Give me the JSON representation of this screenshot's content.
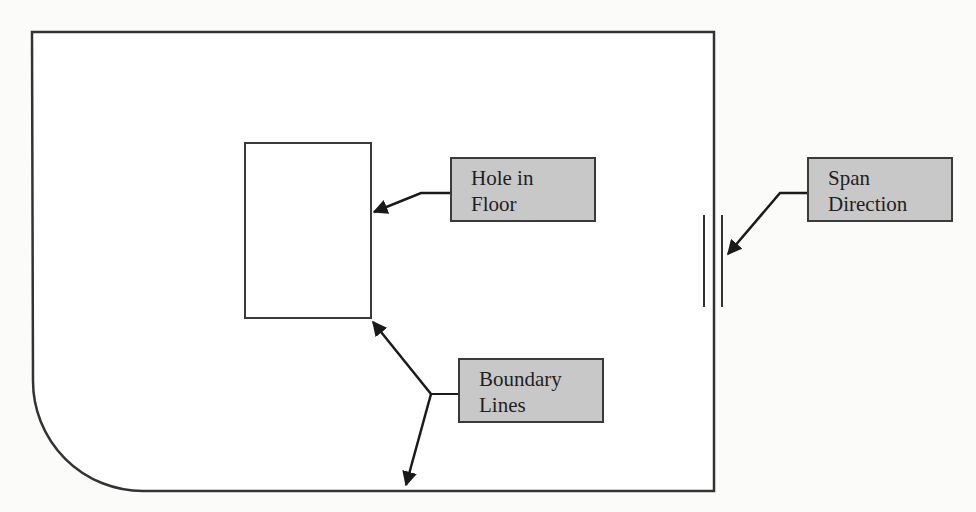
{
  "diagram": {
    "type": "floor-plan-annotation",
    "colors": {
      "stroke": "#333333",
      "label_fill": "#c8c8c8",
      "label_border": "#3a3a3a",
      "background": "#fbfbfa"
    },
    "shapes": {
      "outer_boundary": "Floor slab outline with rounded bottom-left corner",
      "hole": "Rectangular hole in floor",
      "span_indicator": "Three parallel vertical lines indicating span direction"
    },
    "labels": {
      "hole_in_floor": {
        "line1": "Hole in",
        "line2": "Floor"
      },
      "span_direction": {
        "line1": "Span",
        "line2": "Direction"
      },
      "boundary_lines": {
        "line1": "Boundary",
        "line2": "Lines"
      }
    }
  }
}
